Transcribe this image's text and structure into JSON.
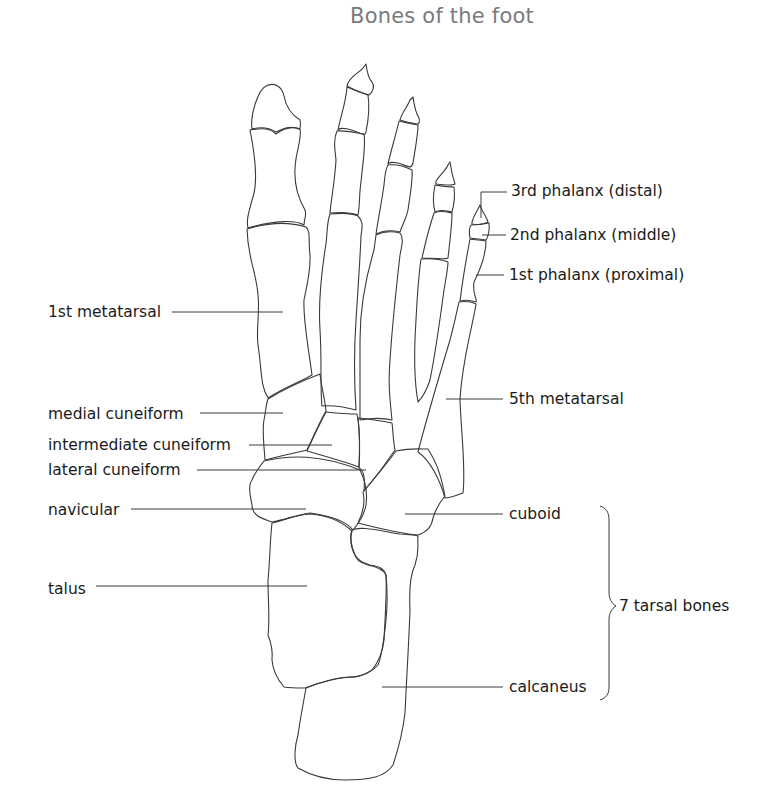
{
  "title": "Bones of the foot",
  "labels": {
    "distal": "3rd phalanx (distal)",
    "middle": "2nd phalanx (middle)",
    "proximal": "1st phalanx (proximal)",
    "first_metatarsal": "1st metatarsal",
    "fifth_metatarsal": "5th metatarsal",
    "medial_cuneiform": "medial cuneiform",
    "intermediate_cuneiform": "intermediate cuneiform",
    "lateral_cuneiform": "lateral cuneiform",
    "navicular": "navicular",
    "cuboid": "cuboid",
    "talus": "talus",
    "calcaneus": "calcaneus",
    "tarsal_group": "7 tarsal bones"
  },
  "colors": {
    "title": "#7a7a7a",
    "labels": "#1a1a1a",
    "lines": "#3a3a3a",
    "background": "#ffffff"
  }
}
